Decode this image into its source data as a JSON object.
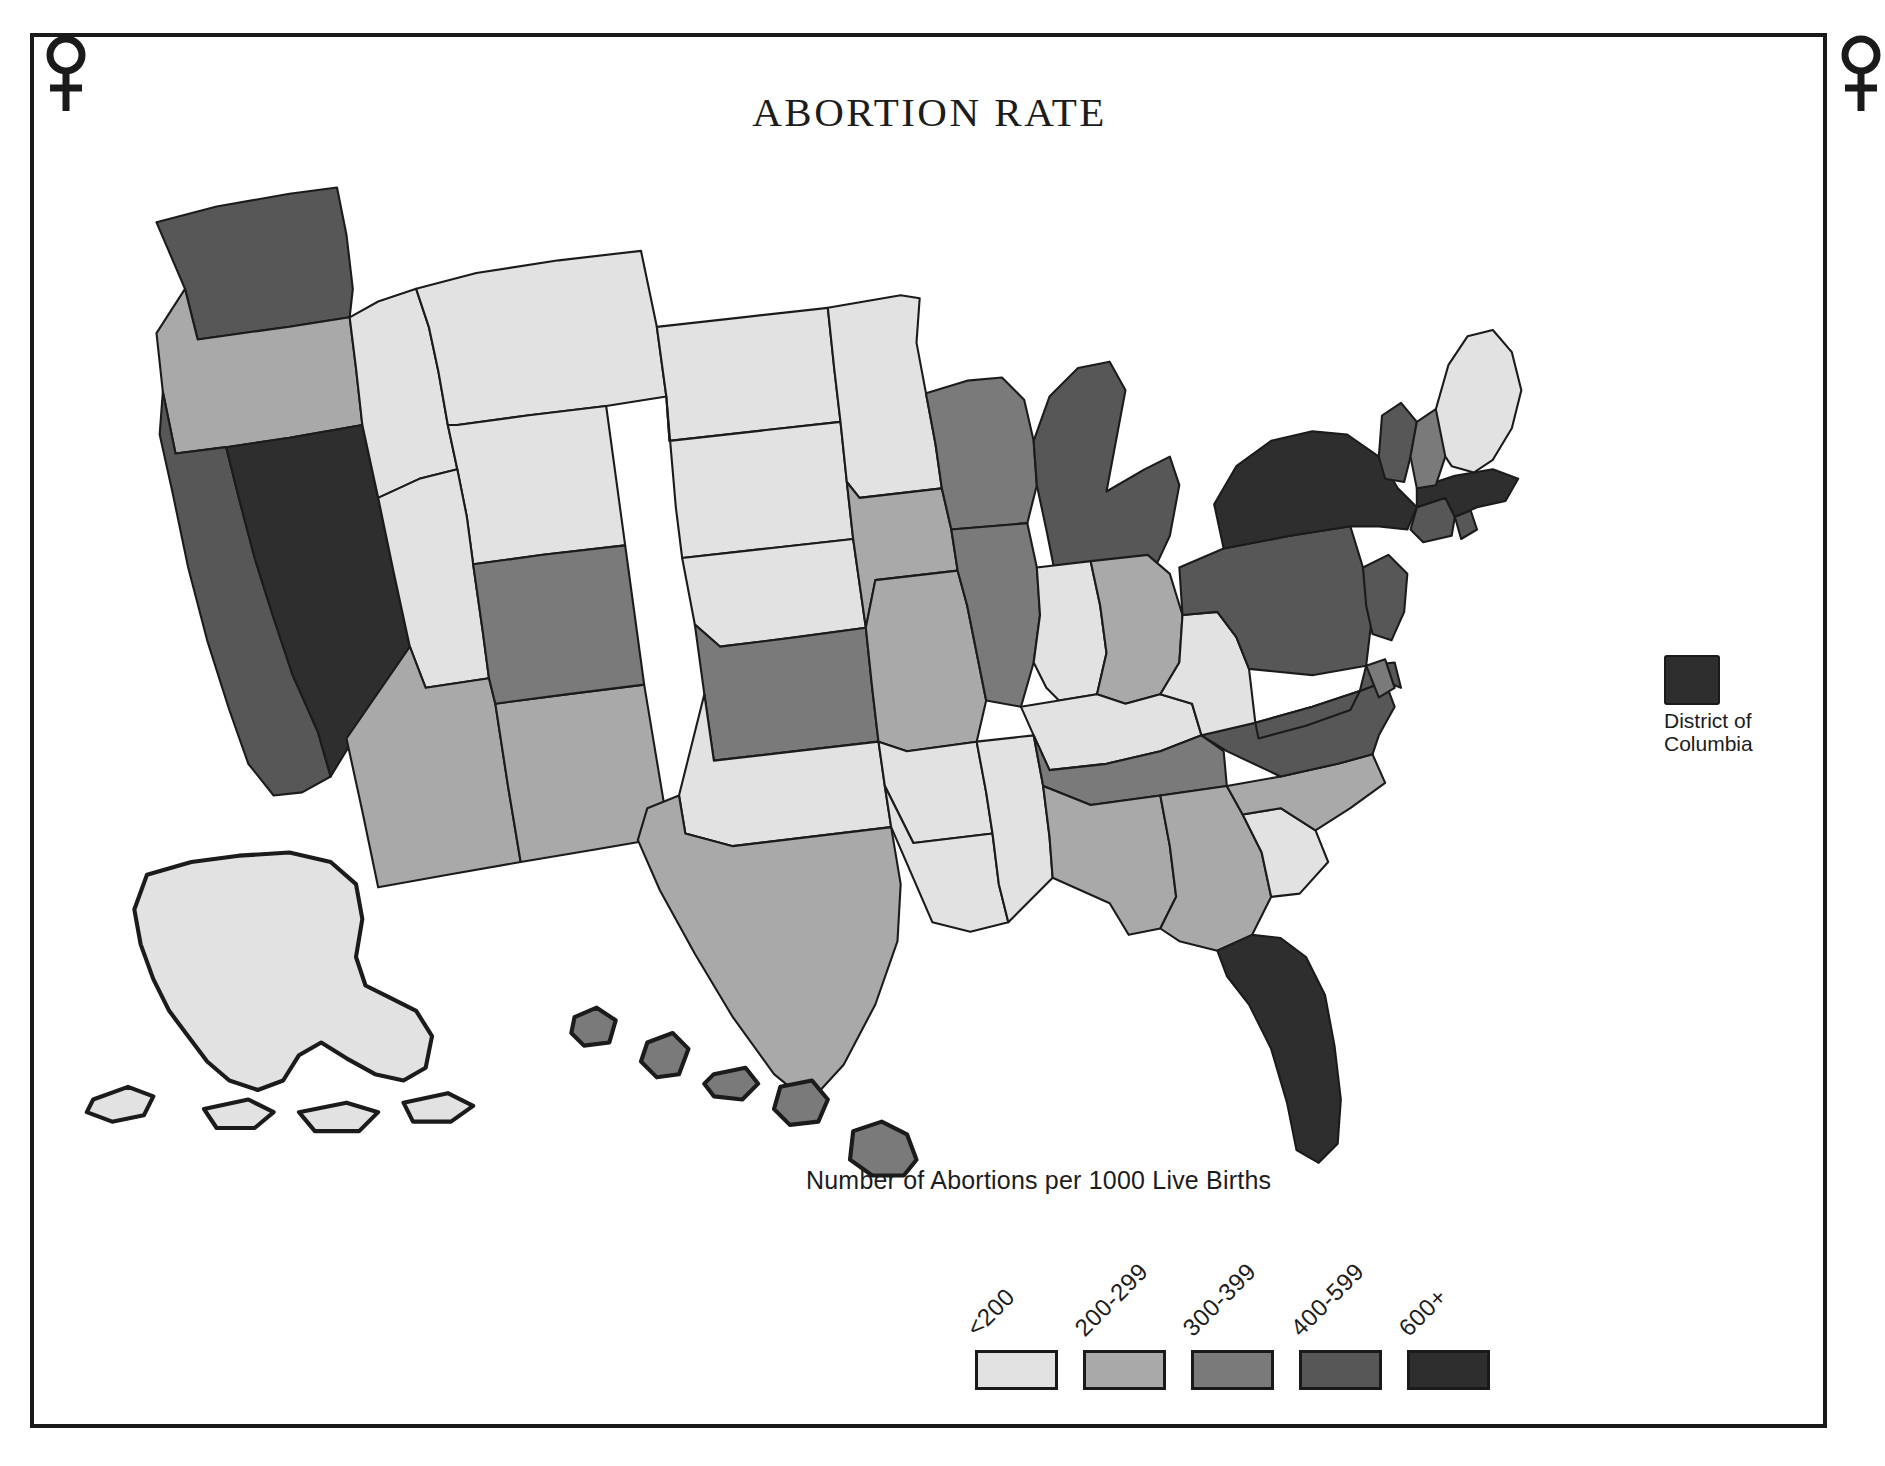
{
  "title": "ABORTION RATE",
  "subtitle": "Number of Abortions per 1000 Live Births",
  "frame": {
    "ornament_icon": "venus-symbol",
    "ornament_count": 2,
    "border_color": "#1a1a1a"
  },
  "dc_callout": {
    "label_line1": "District of",
    "label_line2": "Columbia",
    "swatch_color": "#2e2e2e",
    "bin": "600+"
  },
  "legend": {
    "items": [
      {
        "label": "<200",
        "color": "#e2e2e2"
      },
      {
        "label": "200-299",
        "color": "#a9a9a9"
      },
      {
        "label": "300-399",
        "color": "#7a7a7a"
      },
      {
        "label": "400-599",
        "color": "#575757"
      },
      {
        "label": "600+",
        "color": "#2e2e2e"
      }
    ]
  },
  "chart_data": {
    "type": "map",
    "map_kind": "choropleth",
    "region": "United States",
    "title": "ABORTION RATE",
    "subtitle": "Number of Abortions per 1000 Live Births",
    "unit": "abortions per 1000 live births",
    "legend_position": "bottom-right",
    "bins": [
      {
        "label": "<200",
        "min": 0,
        "max": 199,
        "color": "#e2e2e2"
      },
      {
        "label": "200-299",
        "min": 200,
        "max": 299,
        "color": "#a9a9a9"
      },
      {
        "label": "300-399",
        "min": 300,
        "max": 399,
        "color": "#7a7a7a"
      },
      {
        "label": "400-599",
        "min": 400,
        "max": 599,
        "color": "#575757"
      },
      {
        "label": "600+",
        "min": 600,
        "max": null,
        "color": "#2e2e2e"
      }
    ],
    "values": {
      "AL": "200-299",
      "AK": "<200",
      "AZ": "200-299",
      "AR": "<200",
      "CA": "400-599",
      "CO": "300-399",
      "CT": "400-599",
      "DE": "300-399",
      "DC": "600+",
      "FL": "600+",
      "GA": "200-299",
      "HI": "300-399",
      "ID": "<200",
      "IL": "300-399",
      "IN": "<200",
      "IA": "200-299",
      "KS": "300-399",
      "KY": "<200",
      "LA": "<200",
      "ME": "<200",
      "MD": "400-599",
      "MA": "600+",
      "MI": "400-599",
      "MN": "<200",
      "MS": "<200",
      "MO": "200-299",
      "MT": "<200",
      "NE": "<200",
      "NV": "600+",
      "NH": "300-399",
      "NJ": "400-599",
      "NM": "200-299",
      "NY": "600+",
      "NC": "200-299",
      "ND": "<200",
      "OH": "200-299",
      "OK": "<200",
      "OR": "200-299",
      "PA": "400-599",
      "RI": "400-599",
      "SC": "<200",
      "SD": "<200",
      "TN": "300-399",
      "TX": "200-299",
      "UT": "<200",
      "VT": "400-599",
      "VA": "400-599",
      "WA": "400-599",
      "WV": "<200",
      "WI": "300-399",
      "WY": "<200"
    },
    "states": [
      {
        "code": "WA",
        "name": "Washington"
      },
      {
        "code": "OR",
        "name": "Oregon"
      },
      {
        "code": "CA",
        "name": "California"
      },
      {
        "code": "NV",
        "name": "Nevada"
      },
      {
        "code": "ID",
        "name": "Idaho"
      },
      {
        "code": "MT",
        "name": "Montana"
      },
      {
        "code": "WY",
        "name": "Wyoming"
      },
      {
        "code": "UT",
        "name": "Utah"
      },
      {
        "code": "AZ",
        "name": "Arizona"
      },
      {
        "code": "NM",
        "name": "New Mexico"
      },
      {
        "code": "CO",
        "name": "Colorado"
      },
      {
        "code": "ND",
        "name": "North Dakota"
      },
      {
        "code": "SD",
        "name": "South Dakota"
      },
      {
        "code": "NE",
        "name": "Nebraska"
      },
      {
        "code": "KS",
        "name": "Kansas"
      },
      {
        "code": "OK",
        "name": "Oklahoma"
      },
      {
        "code": "TX",
        "name": "Texas"
      },
      {
        "code": "MN",
        "name": "Minnesota"
      },
      {
        "code": "IA",
        "name": "Iowa"
      },
      {
        "code": "MO",
        "name": "Missouri"
      },
      {
        "code": "AR",
        "name": "Arkansas"
      },
      {
        "code": "LA",
        "name": "Louisiana"
      },
      {
        "code": "WI",
        "name": "Wisconsin"
      },
      {
        "code": "IL",
        "name": "Illinois"
      },
      {
        "code": "MS",
        "name": "Mississippi"
      },
      {
        "code": "MI",
        "name": "Michigan"
      },
      {
        "code": "IN",
        "name": "Indiana"
      },
      {
        "code": "OH",
        "name": "Ohio"
      },
      {
        "code": "KY",
        "name": "Kentucky"
      },
      {
        "code": "TN",
        "name": "Tennessee"
      },
      {
        "code": "AL",
        "name": "Alabama"
      },
      {
        "code": "GA",
        "name": "Georgia"
      },
      {
        "code": "FL",
        "name": "Florida"
      },
      {
        "code": "SC",
        "name": "South Carolina"
      },
      {
        "code": "NC",
        "name": "North Carolina"
      },
      {
        "code": "VA",
        "name": "Virginia"
      },
      {
        "code": "WV",
        "name": "West Virginia"
      },
      {
        "code": "MD",
        "name": "Maryland"
      },
      {
        "code": "DE",
        "name": "Delaware"
      },
      {
        "code": "PA",
        "name": "Pennsylvania"
      },
      {
        "code": "NJ",
        "name": "New Jersey"
      },
      {
        "code": "NY",
        "name": "New York"
      },
      {
        "code": "CT",
        "name": "Connecticut"
      },
      {
        "code": "RI",
        "name": "Rhode Island"
      },
      {
        "code": "MA",
        "name": "Massachusetts"
      },
      {
        "code": "VT",
        "name": "Vermont"
      },
      {
        "code": "NH",
        "name": "New Hampshire"
      },
      {
        "code": "ME",
        "name": "Maine"
      },
      {
        "code": "AK",
        "name": "Alaska"
      },
      {
        "code": "HI",
        "name": "Hawaii"
      },
      {
        "code": "DC",
        "name": "District of Columbia"
      }
    ]
  }
}
